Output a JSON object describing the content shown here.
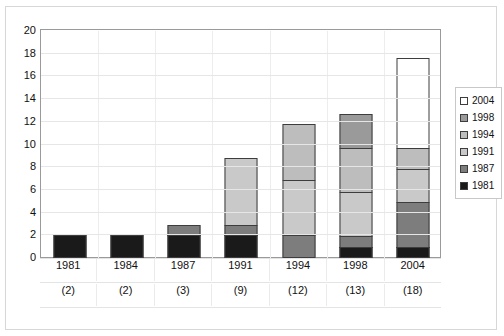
{
  "top_caption": "",
  "chart_data": {
    "type": "bar",
    "subtype": "stacked-bar",
    "title": "",
    "xlabel": "",
    "ylabel": "",
    "ylim": [
      0,
      20
    ],
    "ytick_step": 2,
    "yticks": [
      20,
      18,
      16,
      14,
      12,
      10,
      8,
      6,
      4,
      2,
      0
    ],
    "grid": true,
    "legend_position": "right",
    "categories": [
      "1981",
      "1984",
      "1987",
      "1991",
      "1994",
      "1998",
      "2004"
    ],
    "category_sublabels": [
      "(2)",
      "(2)",
      "(3)",
      "(9)",
      "(12)",
      "(13)",
      "(18)"
    ],
    "totals": [
      2,
      2,
      3,
      9,
      12,
      13,
      18
    ],
    "series": [
      {
        "name": "1981",
        "color": "#1a1a1a",
        "values": [
          2,
          2,
          2,
          2,
          0,
          1,
          1
        ]
      },
      {
        "name": "1987",
        "color": "#7d7d7d",
        "values": [
          0,
          0,
          1,
          1,
          2,
          1,
          4
        ]
      },
      {
        "name": "1991",
        "color": "#c9c9c9",
        "values": [
          0,
          0,
          0,
          6,
          5,
          4,
          3
        ]
      },
      {
        "name": "1994",
        "color": "#bdbdbd",
        "values": [
          0,
          0,
          0,
          0,
          5,
          4,
          2
        ]
      },
      {
        "name": "1998",
        "color": "#9a9a9a",
        "values": [
          0,
          0,
          0,
          0,
          0,
          3,
          0
        ]
      },
      {
        "name": "2004",
        "color": "#ffffff",
        "values": [
          0,
          0,
          0,
          0,
          0,
          0,
          8
        ]
      }
    ],
    "legend_order": [
      "2004",
      "1998",
      "1994",
      "1991",
      "1987",
      "1981"
    ]
  },
  "colors": {
    "axis": "#9a9a9a",
    "gridline": "#e6e6e6",
    "bar_outline": "#3d3d3d",
    "frame": "#d7d7d7",
    "text": "#111111",
    "background": "#ffffff"
  }
}
